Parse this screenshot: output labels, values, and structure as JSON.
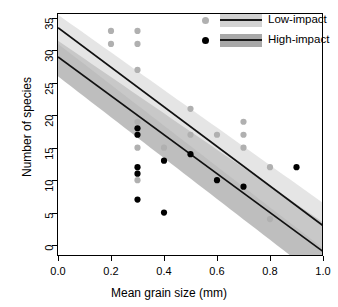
{
  "chart_data": {
    "type": "scatter",
    "title": "",
    "xlabel": "Mean grain size (mm)",
    "ylabel": "Number of species",
    "xlim": [
      0.0,
      1.0
    ],
    "ylim": [
      0,
      35
    ],
    "xticks": [
      "0.0",
      "0.2",
      "0.4",
      "0.6",
      "0.8",
      "1.0"
    ],
    "xtick_values": [
      0.0,
      0.2,
      0.4,
      0.6,
      0.8,
      1.0
    ],
    "yticks": [
      "0",
      "5",
      "10",
      "15",
      "20",
      "25",
      "30",
      "35"
    ],
    "ytick_values": [
      0,
      5,
      10,
      15,
      20,
      25,
      30,
      35
    ],
    "grid": false,
    "legend_position": "top-right",
    "series": [
      {
        "name": "Low-impact",
        "color": "#b0b0b0",
        "marker": "filled-circle",
        "points": [
          {
            "x": 0.2,
            "y": 33
          },
          {
            "x": 0.2,
            "y": 31
          },
          {
            "x": 0.3,
            "y": 33
          },
          {
            "x": 0.3,
            "y": 31
          },
          {
            "x": 0.3,
            "y": 27
          },
          {
            "x": 0.3,
            "y": 19
          },
          {
            "x": 0.3,
            "y": 15
          },
          {
            "x": 0.3,
            "y": 10
          },
          {
            "x": 0.4,
            "y": 15
          },
          {
            "x": 0.5,
            "y": 21
          },
          {
            "x": 0.5,
            "y": 17
          },
          {
            "x": 0.6,
            "y": 17
          },
          {
            "x": 0.7,
            "y": 19
          },
          {
            "x": 0.7,
            "y": 17
          },
          {
            "x": 0.7,
            "y": 15
          },
          {
            "x": 0.8,
            "y": 12
          },
          {
            "x": 0.8,
            "y": 4
          }
        ],
        "fit_line": {
          "intercept": 33.5,
          "slope": -30.5
        },
        "band_color": "#cfcfcf",
        "band_upper": {
          "intercept": 35.5,
          "slope": -29.0
        },
        "band_lower": {
          "intercept": 31.0,
          "slope": -31.5
        }
      },
      {
        "name": "High-impact",
        "color": "#000000",
        "marker": "filled-circle",
        "points": [
          {
            "x": 0.3,
            "y": 18
          },
          {
            "x": 0.3,
            "y": 17
          },
          {
            "x": 0.3,
            "y": 12
          },
          {
            "x": 0.3,
            "y": 11
          },
          {
            "x": 0.3,
            "y": 7
          },
          {
            "x": 0.4,
            "y": 13
          },
          {
            "x": 0.4,
            "y": 5
          },
          {
            "x": 0.5,
            "y": 14
          },
          {
            "x": 0.6,
            "y": 10
          },
          {
            "x": 0.7,
            "y": 9
          },
          {
            "x": 0.9,
            "y": 12
          }
        ],
        "fit_line": {
          "intercept": 29.0,
          "slope": -30.0
        },
        "band_color": "#a8a8a8",
        "band_upper": {
          "intercept": 31.5,
          "slope": -28.0
        },
        "band_lower": {
          "intercept": 26.0,
          "slope": -31.5
        }
      }
    ]
  },
  "legend": {
    "items": [
      {
        "label": "Low-impact",
        "dot_color": "#b0b0b0",
        "band_color": "#d2d2d2",
        "line_color": "#1a1a1a"
      },
      {
        "label": "High-impact",
        "dot_color": "#000000",
        "band_color": "#a8a8a8",
        "line_color": "#1a1a1a"
      }
    ]
  },
  "axes": {
    "x_title": "Mean grain size (mm)",
    "y_title": "Number of species"
  }
}
